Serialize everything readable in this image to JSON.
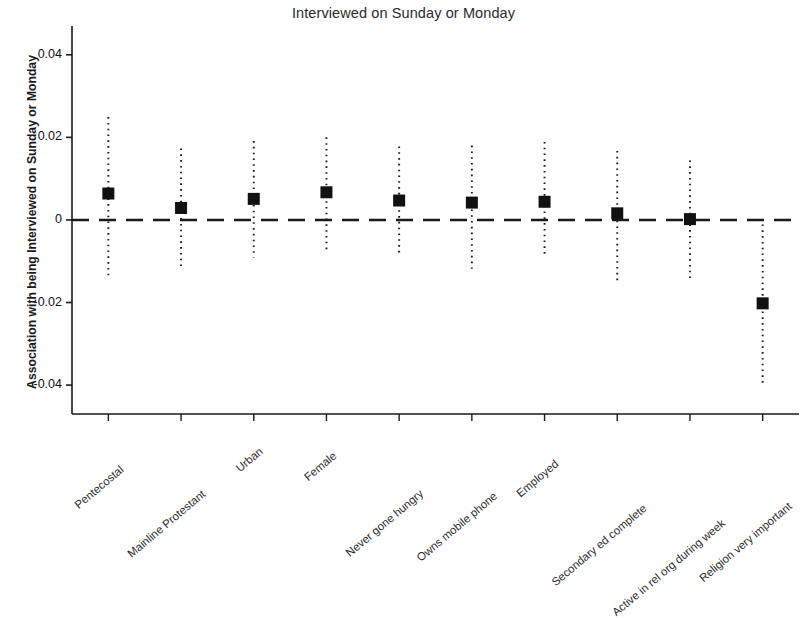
{
  "chart_data": {
    "type": "scatter",
    "title": "Interviewed on Sunday or Monday",
    "xlabel": "",
    "ylabel": "Association with being Interviewed on Sunday or Monday",
    "ylim": [
      -0.047,
      0.046
    ],
    "yticks": [
      0.04,
      0.02,
      0,
      -0.02,
      -0.04
    ],
    "ytick_labels": [
      "0.04",
      "0.02",
      "0",
      "-0.02",
      "-0.04"
    ],
    "grid": false,
    "legend": null,
    "reference_line": {
      "y": 0,
      "style": "dashed",
      "color": "#1a1a1a"
    },
    "marker": {
      "shape": "square",
      "color": "#111111"
    },
    "errorbar": {
      "style": "dotted",
      "color": "#1a1a1a"
    },
    "categories": [
      "Pentecostal",
      "Mainline Protestant",
      "Urban",
      "Female",
      "Never gone hungry",
      "Owns mobile phone",
      "Employed",
      "Secondary ed complete",
      "Active in rel org during week",
      "Religion very important"
    ],
    "values": [
      0.0064,
      0.0029,
      0.0051,
      0.0067,
      0.0047,
      0.0042,
      0.0044,
      0.0016,
      0.0002,
      -0.0202
    ],
    "ci_low": [
      -0.0144,
      -0.0122,
      -0.0091,
      -0.0073,
      -0.0084,
      -0.0118,
      -0.0091,
      -0.0147,
      -0.0147,
      -0.0402
    ],
    "ci_high": [
      0.0249,
      0.0173,
      0.0191,
      0.02,
      0.0178,
      0.018,
      0.0189,
      0.0167,
      0.0144,
      -0.0011
    ]
  },
  "colors": {
    "axis": "#1a1a1a",
    "marker": "#111111",
    "background": "#ffffff"
  }
}
